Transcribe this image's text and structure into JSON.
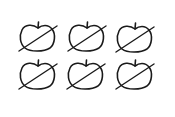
{
  "figure": {
    "rows": 2,
    "columns": 3,
    "stroke_color": "#1a1a1a",
    "background": "#ffffff",
    "items": [
      {
        "label": "crossed-out apple",
        "row": 1,
        "col": 1,
        "x": 17,
        "y": 20
      },
      {
        "label": "crossed-out apple",
        "row": 1,
        "col": 2,
        "x": 66,
        "y": 20
      },
      {
        "label": "crossed-out apple",
        "row": 1,
        "col": 3,
        "x": 114,
        "y": 21
      },
      {
        "label": "crossed-out apple",
        "row": 2,
        "col": 1,
        "x": 17,
        "y": 58
      },
      {
        "label": "crossed-out apple",
        "row": 2,
        "col": 2,
        "x": 65,
        "y": 58
      },
      {
        "label": "crossed-out apple",
        "row": 2,
        "col": 3,
        "x": 114,
        "y": 58
      }
    ]
  }
}
